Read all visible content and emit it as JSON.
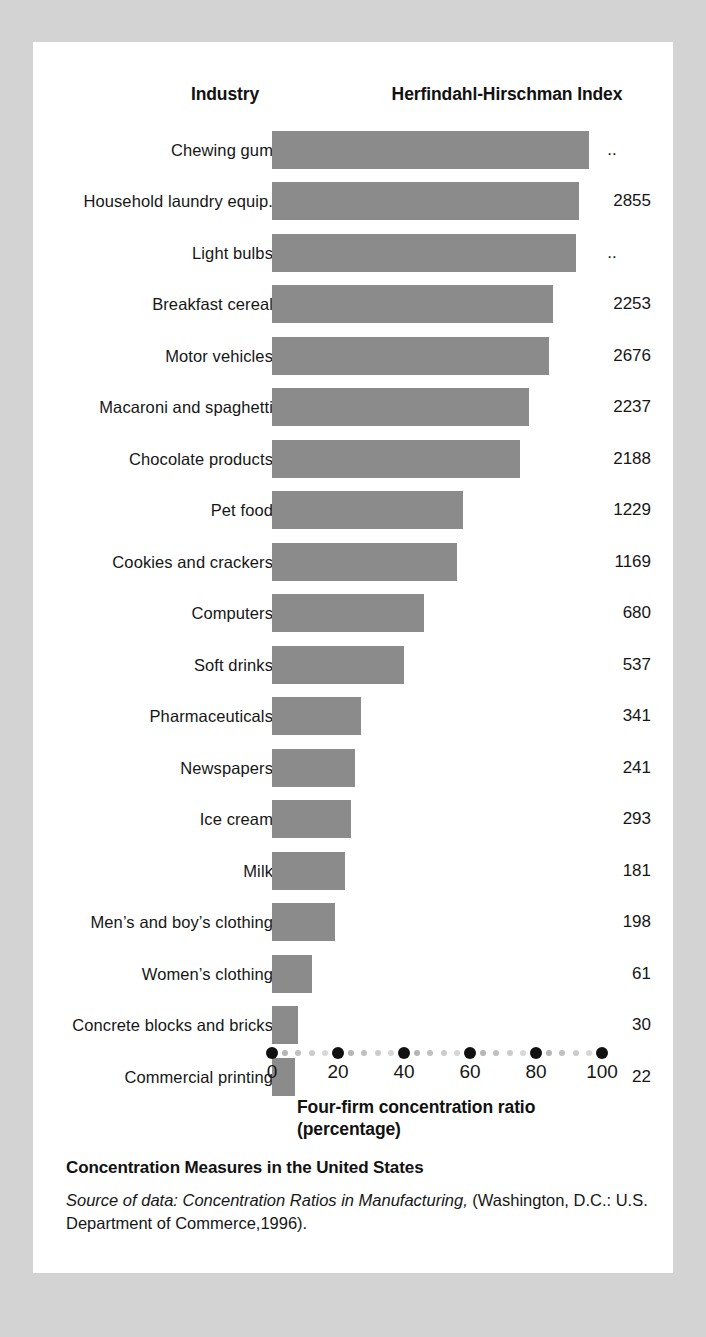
{
  "header": {
    "industry_label": "Industry",
    "index_label": "Herfindahl-Hirschman Index"
  },
  "axis": {
    "title_line1": "Four-firm concentration ratio",
    "title_line2": "(percentage)",
    "tick_labels": [
      "0",
      "20",
      "40",
      "60",
      "80",
      "100"
    ],
    "tick_values": [
      0,
      20,
      40,
      60,
      80,
      100
    ],
    "minor_step": 4
  },
  "footer": {
    "title": "Concentration Measures in the United States",
    "source_italic": "Source of data: Concentration Ratios in Manufacturing,",
    "source_rest": " (Washington, D.C.: U.S. Department of Commerce,1996)."
  },
  "colors": {
    "bar": "#8b8b8b",
    "card": "#ffffff",
    "page": "#d3d3d3",
    "text": "#161616",
    "tick_major": "#111111"
  },
  "chart_data": {
    "type": "bar",
    "orientation": "horizontal",
    "title": "Concentration Measures in the United States",
    "xlabel": "Four-firm concentration ratio (percentage)",
    "ylabel": "Industry",
    "xlim": [
      0,
      100
    ],
    "grid": false,
    "legend": null,
    "value_column_header": "Herfindahl-Hirschman Index",
    "categories": [
      "Chewing gum",
      "Household laundry equip.",
      "Light bulbs",
      "Breakfast cereal",
      "Motor vehicles",
      "Macaroni and spaghetti",
      "Chocolate products",
      "Pet food",
      "Cookies and crackers",
      "Computers",
      "Soft drinks",
      "Pharmaceuticals",
      "Newspapers",
      "Ice cream",
      "Milk",
      "Men’s and boy’s clothing",
      "Women’s clothing",
      "Concrete blocks and bricks",
      "Commercial printing"
    ],
    "values": [
      96,
      93,
      92,
      85,
      84,
      78,
      75,
      58,
      56,
      46,
      40,
      27,
      25,
      24,
      22,
      19,
      12,
      8,
      7
    ],
    "hhi": [
      "..",
      "2855",
      "..",
      "2253",
      "2676",
      "2237",
      "2188",
      "1229",
      "1169",
      "680",
      "537",
      "341",
      "241",
      "293",
      "181",
      "198",
      "61",
      "30",
      "22"
    ],
    "rows": [
      {
        "industry": "Chewing gum",
        "ratio": 96,
        "hhi": ".."
      },
      {
        "industry": "Household laundry equip.",
        "ratio": 93,
        "hhi": "2855"
      },
      {
        "industry": "Light bulbs",
        "ratio": 92,
        "hhi": ".."
      },
      {
        "industry": "Breakfast cereal",
        "ratio": 85,
        "hhi": "2253"
      },
      {
        "industry": "Motor vehicles",
        "ratio": 84,
        "hhi": "2676"
      },
      {
        "industry": "Macaroni and spaghetti",
        "ratio": 78,
        "hhi": "2237"
      },
      {
        "industry": "Chocolate products",
        "ratio": 75,
        "hhi": "2188"
      },
      {
        "industry": "Pet food",
        "ratio": 58,
        "hhi": "1229"
      },
      {
        "industry": "Cookies and crackers",
        "ratio": 56,
        "hhi": "1169"
      },
      {
        "industry": "Computers",
        "ratio": 46,
        "hhi": "680"
      },
      {
        "industry": "Soft drinks",
        "ratio": 40,
        "hhi": "537"
      },
      {
        "industry": "Pharmaceuticals",
        "ratio": 27,
        "hhi": "341"
      },
      {
        "industry": "Newspapers",
        "ratio": 25,
        "hhi": "241"
      },
      {
        "industry": "Ice cream",
        "ratio": 24,
        "hhi": "293"
      },
      {
        "industry": "Milk",
        "ratio": 22,
        "hhi": "181"
      },
      {
        "industry": "Men’s and boy’s clothing",
        "ratio": 19,
        "hhi": "198"
      },
      {
        "industry": "Women’s clothing",
        "ratio": 12,
        "hhi": "61"
      },
      {
        "industry": "Concrete blocks and bricks",
        "ratio": 8,
        "hhi": "30"
      },
      {
        "industry": "Commercial printing",
        "ratio": 7,
        "hhi": "22"
      }
    ]
  }
}
